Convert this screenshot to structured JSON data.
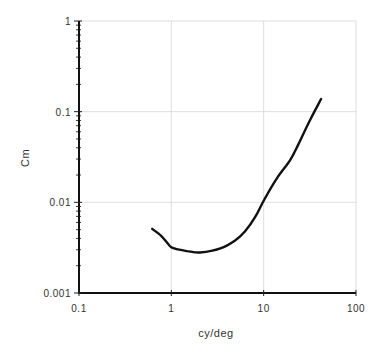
{
  "chart_data": {
    "type": "line",
    "title": "",
    "xlabel": "cy/deg",
    "ylabel": "Cm",
    "xscale": "log",
    "yscale": "log",
    "xlim": [
      0.1,
      100
    ],
    "ylim": [
      0.001,
      1
    ],
    "xticks": [
      0.1,
      1,
      10,
      100
    ],
    "xtick_labels": [
      "0.1",
      "1",
      "10",
      "100"
    ],
    "yticks": [
      0.001,
      0.01,
      0.1,
      1
    ],
    "ytick_labels": [
      "0.001",
      "0.01",
      "0.1",
      "1"
    ],
    "grid": true,
    "legend": null,
    "series": [
      {
        "name": "Cm",
        "color": "#111111",
        "x": [
          0.62,
          0.77,
          0.9,
          1.0,
          1.22,
          1.49,
          2.05,
          3.4,
          4.9,
          6.3,
          8.1,
          10.1,
          14.0,
          19.3,
          23.6,
          31.8,
          41.9
        ],
        "y": [
          0.0051,
          0.0043,
          0.0036,
          0.0032,
          0.003,
          0.0029,
          0.0028,
          0.0031,
          0.0038,
          0.0048,
          0.0069,
          0.0106,
          0.0186,
          0.029,
          0.043,
          0.081,
          0.138
        ]
      }
    ]
  },
  "layout": {
    "plot_left": 79,
    "plot_right": 356,
    "plot_top": 21,
    "plot_bottom": 293
  }
}
